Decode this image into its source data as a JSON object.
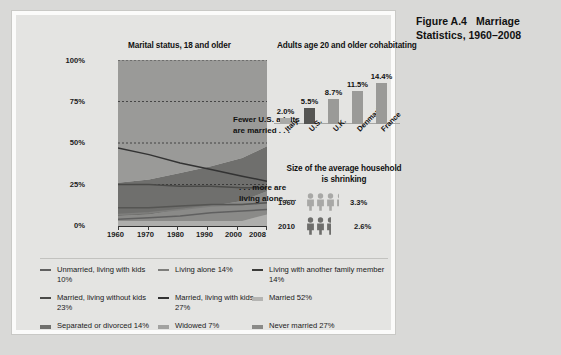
{
  "figure": {
    "number": "Figure A.4",
    "title": "Marriage Statistics, 1960–2008"
  },
  "sections": {
    "marital_title": "Marital status, 18 and older",
    "cohabiting_title": "Adults age 20 and older cohabitating",
    "household_title": "Size of the average household is shrinking"
  },
  "callouts": {
    "married_line1": "Fewer U.S. adults",
    "married_line2": "are married . . .",
    "alone_line1": ". . . more are",
    "alone_line2": "living alone . . ."
  },
  "chart_data": [
    {
      "type": "area",
      "title": "Marital status, 18 and older",
      "xlabel": "",
      "ylabel": "",
      "x": [
        1960,
        1970,
        1980,
        1990,
        2000,
        2008
      ],
      "xticklabels": [
        "1960",
        "1970",
        "1980",
        "1990",
        "2000",
        "2008"
      ],
      "yticklabels": [
        "0%",
        "25%",
        "50%",
        "75%",
        "100%"
      ],
      "ylim": [
        0,
        100
      ],
      "grid": "dotted-horizontal",
      "series": [
        {
          "name": "Married 52%",
          "kind": "area",
          "color": "#9a9a98",
          "values": [
            74,
            72,
            68,
            64,
            59,
            52
          ]
        },
        {
          "name": "Never married 27%",
          "kind": "area",
          "color": "#6f6f6d",
          "values": [
            20,
            21,
            22,
            24,
            26,
            27
          ]
        },
        {
          "name": "Separated or divorced 14%",
          "kind": "area",
          "color": "#8a8a88",
          "values": [
            3,
            4,
            7,
            9,
            12,
            14
          ]
        },
        {
          "name": "Widowed 7%",
          "kind": "area",
          "color": "#aeaeac",
          "values": [
            3,
            3,
            3,
            3,
            3,
            7
          ]
        },
        {
          "name": "Married, living with kids 27%",
          "kind": "line",
          "color": "#333333",
          "values": [
            47,
            43,
            38,
            34,
            30,
            27
          ]
        },
        {
          "name": "Married, living without kids 23%",
          "kind": "line",
          "color": "#4a4a48",
          "values": [
            25,
            25,
            24,
            24,
            23,
            23
          ]
        },
        {
          "name": "Living alone 14%",
          "kind": "line",
          "color": "#7e7e7c",
          "values": [
            7,
            8,
            10,
            12,
            13,
            14
          ]
        },
        {
          "name": "Living with another family member 14%",
          "kind": "line",
          "color": "#555553",
          "values": [
            11,
            11,
            12,
            13,
            13,
            14
          ]
        },
        {
          "name": "Unmarried, living with kids 10%",
          "kind": "line",
          "color": "#606060",
          "values": [
            4,
            5,
            6,
            8,
            9,
            10
          ]
        }
      ]
    },
    {
      "type": "bar",
      "title": "Adults age 20 and older cohabitating",
      "categories": [
        "Italy",
        "U.S.",
        "U.K.",
        "Denmark",
        "France"
      ],
      "values": [
        2.0,
        5.5,
        8.7,
        11.5,
        14.4
      ],
      "value_labels": [
        "2.0%",
        "5.5%",
        "8.7%",
        "11.5%",
        "14.4%"
      ],
      "ylim": [
        0,
        16
      ],
      "colors": [
        "#a9a9a7",
        "#555553",
        "#9a9a98",
        "#9a9a98",
        "#9a9a98"
      ],
      "highlight": "U.S."
    },
    {
      "type": "pictograph",
      "title": "Size of the average household is shrinking",
      "categories": [
        "1960",
        "2010"
      ],
      "values": [
        3.3,
        2.6
      ],
      "value_labels": [
        "3.3%",
        "2.6%"
      ],
      "unit": "person-icon",
      "colors": [
        "#a8a8a6",
        "#6e6e6c"
      ]
    }
  ],
  "legend": {
    "items": [
      {
        "label": "Unmarried, living with kids 10%",
        "marker": "line",
        "color": "#606060"
      },
      {
        "label": "Living alone 14%",
        "marker": "line",
        "color": "#7e7e7c"
      },
      {
        "label": "Living with another family member 14%",
        "marker": "line",
        "color": "#3c3c3a"
      },
      {
        "label": "Married, living without kids 23%",
        "marker": "line",
        "color": "#4a4a48"
      },
      {
        "label": "Married, living with kids 27%",
        "marker": "line",
        "color": "#333333"
      },
      {
        "label": "Married 52%",
        "marker": "block",
        "color": "#b4b4b2"
      },
      {
        "label": "Separated or divorced 14%",
        "marker": "block",
        "color": "#6f6f6d"
      },
      {
        "label": "Widowed 7%",
        "marker": "block",
        "color": "#a2a2a0"
      },
      {
        "label": "Never married 27%",
        "marker": "block",
        "color": "#8a8a88"
      }
    ]
  },
  "axis": {
    "y": [
      "100%",
      "75%",
      "50%",
      "25%",
      "0%"
    ],
    "x": [
      "1960",
      "1970",
      "1980",
      "1990",
      "2000",
      "2008"
    ]
  }
}
